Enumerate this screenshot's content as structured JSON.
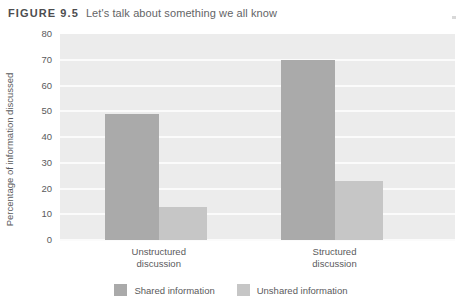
{
  "figure": {
    "label": "FIGURE 9.5",
    "title": "Let's talk about something we all know"
  },
  "chart_data": {
    "type": "bar",
    "title": "Let's talk about something we all know",
    "categories": [
      "Unstructured discussion",
      "Structured discussion"
    ],
    "category_lines": [
      [
        "Unstructured",
        "discussion"
      ],
      [
        "Structured",
        "discussion"
      ]
    ],
    "series": [
      {
        "name": "Shared information",
        "values": [
          49,
          70
        ],
        "color": "#aaaaaa"
      },
      {
        "name": "Unshared information",
        "values": [
          13,
          23
        ],
        "color": "#c6c6c6"
      }
    ],
    "xlabel": "",
    "ylabel": "Percentage of information discussed",
    "ylim": [
      0,
      80
    ],
    "yticks": [
      80,
      70,
      60,
      50,
      40,
      30,
      20,
      10,
      0
    ],
    "grid": true,
    "legend_position": "bottom",
    "plot_background": "#ececec",
    "gridline_color": "#fbfbfb"
  }
}
